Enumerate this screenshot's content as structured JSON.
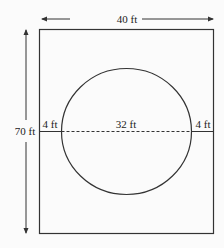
{
  "diagram": {
    "width_label": "40 ft",
    "height_label": "70 ft",
    "left_gap_label": "4 ft",
    "diameter_label": "32 ft",
    "right_gap_label": "4 ft",
    "colors": {
      "stroke": "#333333",
      "background": "#fbfbfb"
    }
  }
}
